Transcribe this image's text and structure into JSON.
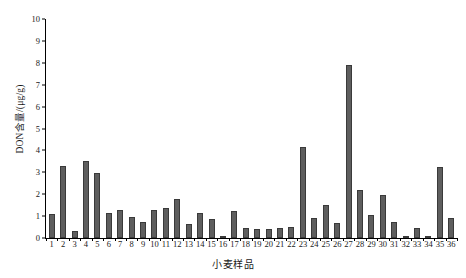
{
  "chart_data": {
    "type": "bar",
    "title": "",
    "xlabel": "小麦样品",
    "ylabel": "DON含量/(μg/g)",
    "ylim": [
      0,
      10
    ],
    "ytick_step": 1,
    "grid": false,
    "legend": null,
    "bar_color": "#5e5e5e",
    "bar_edge_color": "#3a3a3a",
    "axis_color": "#000000",
    "background_color": "#ffffff",
    "categories": [
      "1",
      "2",
      "3",
      "4",
      "5",
      "6",
      "7",
      "8",
      "9",
      "10",
      "11",
      "12",
      "13",
      "14",
      "15",
      "16",
      "17",
      "18",
      "19",
      "20",
      "21",
      "22",
      "23",
      "24",
      "25",
      "26",
      "27",
      "28",
      "29",
      "30",
      "31",
      "32",
      "33",
      "34",
      "35",
      "36"
    ],
    "values": [
      1.1,
      3.3,
      0.3,
      3.5,
      2.95,
      1.15,
      1.3,
      0.95,
      0.75,
      1.3,
      1.35,
      1.8,
      0.65,
      1.15,
      0.85,
      0.05,
      1.25,
      0.45,
      0.4,
      0.4,
      0.45,
      0.5,
      4.15,
      0.9,
      1.5,
      0.7,
      7.9,
      2.2,
      1.05,
      1.95,
      0.75,
      0.05,
      0.45,
      0.05,
      3.25,
      0.9
    ],
    "ytick_labels": [
      "0",
      "1",
      "2",
      "3",
      "4",
      "5",
      "6",
      "7",
      "8",
      "9",
      "10"
    ],
    "ytick_values": [
      0,
      1,
      2,
      3,
      4,
      5,
      6,
      7,
      8,
      9,
      10
    ]
  }
}
